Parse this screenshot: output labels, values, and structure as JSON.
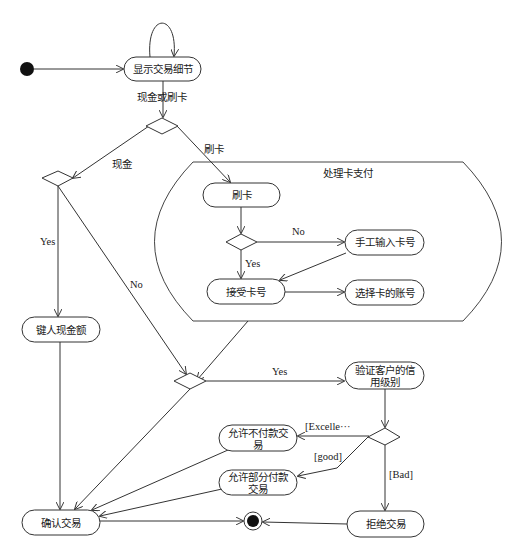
{
  "diagram": {
    "type": "UML activity diagram",
    "region": {
      "label": "处理卡支付"
    },
    "nodes": {
      "show_details": {
        "label": "显示交易细节"
      },
      "swipe": {
        "label": "刷卡"
      },
      "manual_entry": {
        "label": "手工输入卡号"
      },
      "accept_card": {
        "label": "接受卡号"
      },
      "select_account": {
        "label": "选择卡的账号"
      },
      "enter_cash": {
        "label": "键人现金额"
      },
      "verify_credit": {
        "label_line1": "验证客户的信",
        "label_line2": "用级别"
      },
      "allow_no_pay": {
        "label_line1": "允许不付款交",
        "label_line2": "易"
      },
      "allow_partial": {
        "label_line1": "允许部分付款",
        "label_line2": "交易"
      },
      "confirm": {
        "label": "确认交易"
      },
      "reject": {
        "label": "拒绝交易"
      }
    },
    "edge_labels": {
      "cash_or_card": "现金或刷卡",
      "cash": "现金",
      "card": "刷卡",
      "swipe_no": "No",
      "swipe_yes": "Yes",
      "cash_yes": "Yes",
      "cash_no": "No",
      "merge_yes": "Yes",
      "excellent": "[Excelle···",
      "good": "[good]",
      "bad": "[Bad]"
    },
    "colors": {
      "stroke": "#333333",
      "background": "#ffffff",
      "text": "#1a1a1a"
    }
  }
}
